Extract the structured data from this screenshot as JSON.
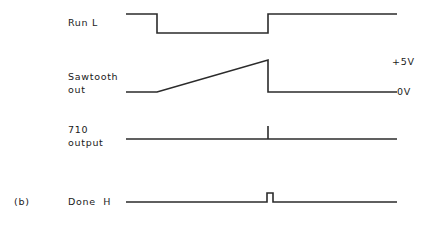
{
  "figure": {
    "caption": "(b)",
    "background_color": "#ffffff",
    "trace_color": "#2b2b2b",
    "text_color": "#1a1a1a"
  },
  "axis_labels": {
    "high_level": "+5V",
    "low_level": "0V"
  },
  "signals": [
    {
      "name": "run-l",
      "label": "Run L",
      "label_lines": [
        "Run L"
      ],
      "type": "digital-active-low",
      "baseline_y": 14,
      "low_y": 33,
      "start_x": 126,
      "end_x": 397,
      "fall_x": 157,
      "rise_x": 268,
      "points": "126,14 157,14 157,33 268,33 268,14 397,14"
    },
    {
      "name": "sawtooth-out",
      "label": "Sawtooth out",
      "label_lines": [
        "Sawtooth",
        "out"
      ],
      "type": "analog-ramp",
      "baseline_y": 92,
      "peak_y": 60,
      "start_x": 126,
      "end_x": 397,
      "ramp_start_x": 157,
      "ramp_end_x": 268,
      "points": "126,92 157,92 268,60 268,92 397,92"
    },
    {
      "name": "710-output",
      "label": "710 output",
      "label_lines": [
        "710",
        "output"
      ],
      "type": "digital-spike",
      "baseline_y": 139,
      "start_x": 126,
      "end_x": 397,
      "spike_x": 268,
      "spike_top_y": 126,
      "points": "126,139 397,139"
    },
    {
      "name": "done-h",
      "label": "Done  H",
      "label_lines": [
        "Done  H"
      ],
      "type": "digital-pulse",
      "baseline_y": 202,
      "start_x": 126,
      "end_x": 397,
      "pulse_start_x": 267,
      "pulse_end_x": 273,
      "pulse_top_y": 193,
      "points": "126,202 267,202 267,193 273,193 273,202 397,202"
    }
  ]
}
